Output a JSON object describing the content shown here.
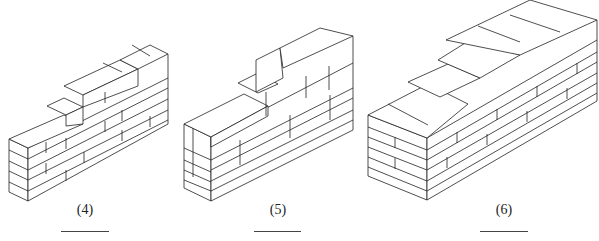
{
  "figures": [
    {
      "label": "(4)",
      "label_x": 85,
      "label_y": 202,
      "blank_x": 61,
      "blank_w": 48,
      "blank_y": 231
    },
    {
      "label": "(5)",
      "label_x": 278,
      "label_y": 202,
      "blank_x": 254,
      "blank_w": 47,
      "blank_y": 231
    },
    {
      "label": "(6)",
      "label_x": 504,
      "label_y": 202,
      "blank_x": 480,
      "blank_w": 48,
      "blank_y": 231
    }
  ],
  "stroke_color": "#222222"
}
